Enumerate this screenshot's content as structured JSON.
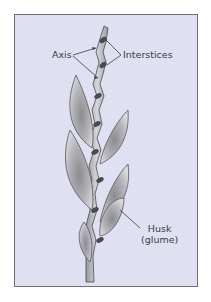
{
  "figure": {
    "background_color": "#dfe1f2",
    "border_color": "#6f7077",
    "leaf_color": "#a9a9ad",
    "leaf_highlight": "#d8d8dc",
    "node_color": "#4a4a4e"
  },
  "labels": {
    "axis": "Axis",
    "interstices": "Interstices",
    "husk_line1": "Husk",
    "husk_line2": "(glume)"
  }
}
